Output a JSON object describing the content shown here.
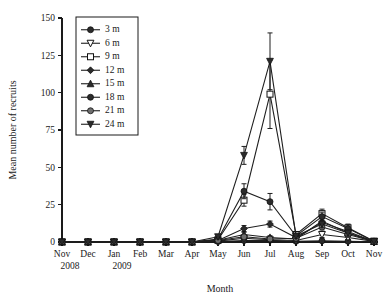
{
  "figure": {
    "background_color": "#ffffff",
    "ink_color": "#1a1a1a"
  },
  "chart_data": {
    "type": "line",
    "title": "",
    "xlabel": "Month",
    "ylabel": "Mean number of recruits",
    "categories": [
      "Nov",
      "Dec",
      "Jan",
      "Feb",
      "Mar",
      "Apr",
      "May",
      "Jun",
      "Jul",
      "Aug",
      "Sep",
      "Oct",
      "Nov"
    ],
    "category_years": [
      {
        "label": "2008",
        "under_category": "Nov"
      },
      {
        "label": "2009",
        "under_category": "Jan"
      }
    ],
    "ylim": [
      0,
      150
    ],
    "yticks": [
      0,
      25,
      50,
      75,
      100,
      125,
      150
    ],
    "grid": false,
    "legend_position": "top-left",
    "legend_title": "",
    "series": [
      {
        "name": "3 m",
        "marker": "filled-circle",
        "values": [
          0,
          0,
          0,
          0,
          0,
          0,
          0.3,
          1.0,
          1.2,
          0.5,
          0.8,
          0.5,
          0.2
        ],
        "errors": [
          0,
          0,
          0,
          0,
          0,
          0,
          0.2,
          0.6,
          0.7,
          0.3,
          0.5,
          0.3,
          0.2
        ]
      },
      {
        "name": "6 m",
        "marker": "open-inverted-triangle",
        "values": [
          0,
          0,
          0,
          0,
          0,
          0,
          0.6,
          2.5,
          1.5,
          1.0,
          5.0,
          3.0,
          0.4
        ],
        "errors": [
          0,
          0,
          0,
          0,
          0,
          0,
          0.3,
          1.2,
          0.8,
          0.5,
          2.0,
          1.5,
          0.3
        ]
      },
      {
        "name": "9 m",
        "marker": "open-square",
        "values": [
          0,
          0,
          0,
          0,
          0,
          0,
          1.5,
          28.0,
          99.0,
          5.0,
          19.0,
          9.5,
          0.5
        ],
        "errors": [
          0,
          0,
          0,
          0,
          0,
          0,
          0.8,
          4.0,
          23.0,
          2.0,
          3.0,
          2.5,
          0.4
        ]
      },
      {
        "name": "12 m",
        "marker": "filled-diamond",
        "values": [
          0,
          0,
          0,
          0,
          0,
          0,
          1.0,
          9.0,
          12.0,
          3.0,
          13.0,
          7.0,
          0.4
        ],
        "errors": [
          0,
          0,
          0,
          0,
          0,
          0,
          0.5,
          2.0,
          2.0,
          1.0,
          2.5,
          2.0,
          0.3
        ]
      },
      {
        "name": "15 m",
        "marker": "filled-triangle",
        "values": [
          0,
          0,
          0,
          0,
          0,
          0,
          1.2,
          5.0,
          3.0,
          2.0,
          14.0,
          6.0,
          0.3
        ],
        "errors": [
          0,
          0,
          0,
          0,
          0,
          0,
          0.6,
          1.5,
          1.2,
          0.8,
          2.5,
          2.0,
          0.3
        ]
      },
      {
        "name": "18 m",
        "marker": "filled-circle",
        "values": [
          0,
          0,
          0,
          0,
          0,
          0,
          2.0,
          34.0,
          27.0,
          4.0,
          17.0,
          9.0,
          0.5
        ],
        "errors": [
          0,
          0,
          0,
          0,
          0,
          0,
          1.0,
          5.0,
          5.5,
          1.5,
          3.0,
          2.5,
          0.4
        ]
      },
      {
        "name": "21 m",
        "marker": "grey-circle",
        "values": [
          0,
          0,
          0,
          0,
          0,
          0,
          1.0,
          3.5,
          2.0,
          2.5,
          10.0,
          5.0,
          0.3
        ],
        "errors": [
          0,
          0,
          0,
          0,
          0,
          0,
          0.5,
          1.0,
          1.0,
          1.0,
          2.0,
          1.5,
          0.3
        ]
      },
      {
        "name": "24 m",
        "marker": "filled-inverted-triangle",
        "values": [
          0,
          0,
          0,
          0,
          0,
          0,
          3.5,
          58.0,
          121.0,
          4.0,
          12.0,
          6.0,
          0.4
        ],
        "errors": [
          0,
          0,
          0,
          0,
          0,
          0,
          1.5,
          6.0,
          19.0,
          1.5,
          2.5,
          2.0,
          0.3
        ]
      }
    ]
  }
}
